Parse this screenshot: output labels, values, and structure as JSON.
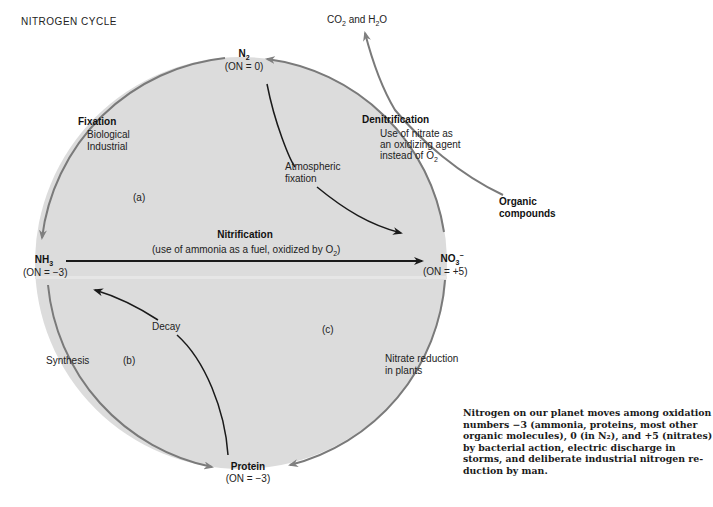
{
  "title": "NITROGEN CYCLE",
  "nodes": {
    "n2": {
      "formula": "N",
      "sub": "2",
      "on": "(ON = 0)"
    },
    "nh3": {
      "formula": "NH",
      "sub": "3",
      "on": "(ON = −3)"
    },
    "no3": {
      "formula": "NO",
      "sub": "3",
      "sup": "−",
      "on": "(ON = +5)"
    },
    "protein": {
      "formula": "Protein",
      "on": "(ON = −3)"
    }
  },
  "processes": {
    "fixation": {
      "title": "Fixation",
      "line1": "Biological",
      "line2": "Industrial"
    },
    "denitrification": {
      "title": "Denitrification",
      "line1": "Use of nitrate as",
      "line2": "an oxidizing agent",
      "line3_pre": "instead of O",
      "line3_sub": "2"
    },
    "atmospheric_fixation": {
      "line1": "Atmospheric",
      "line2": "fixation"
    },
    "nitrification": {
      "title": "Nitrification",
      "desc_pre": "(use of ammonia as a fuel, oxidized by O",
      "desc_sub": "2",
      "desc_post": ")"
    },
    "decay": "Decay",
    "synthesis": "Synthesis",
    "nitrate_reduction": {
      "line1": "Nitrate reduction",
      "line2": "in plants"
    }
  },
  "regions": {
    "a": "(a)",
    "b": "(b)",
    "c": "(c)"
  },
  "external": {
    "co2_h2o": {
      "pre": "CO",
      "sub1": "2",
      "mid": " and H",
      "sub2": "2",
      "post": "O"
    },
    "organic": {
      "line1": "Organic",
      "line2": "compounds"
    }
  },
  "caption": "Nitrogen on our planet moves among oxidation\nnumbers −3 (ammonia, proteins, most other\norganic molecules), 0 (in N₂), and +5 (nitrates)\nby bacterial action, electric discharge in\nstorms, and deliberate industrial nitrogen re-\nduction by man.",
  "colors": {
    "circle_fill": "#dcdcdc",
    "circle_stroke": "#7a7a7a",
    "arrow_dark": "#1a1a1a",
    "arrow_gray": "#808080"
  }
}
